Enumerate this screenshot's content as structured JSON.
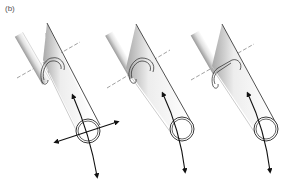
{
  "figure": {
    "panel_label": "(b)",
    "panels": [
      {
        "id": "panel-1",
        "description": "Rod with loop attachment to tube; tube end ring with four-way arrows",
        "arrows": [
          "up",
          "down",
          "left",
          "right"
        ]
      },
      {
        "id": "panel-2",
        "description": "Rod with loop attachment to tube; tube end ring with up/down curved arrow",
        "arrows": [
          "up",
          "down"
        ]
      },
      {
        "id": "panel-3",
        "description": "Rod with clip attachment to tube; tube end ring with up/down curved arrow",
        "arrows": [
          "up",
          "down"
        ]
      }
    ]
  },
  "colors": {
    "line": "#222222",
    "dash": "#777777",
    "shade": "#bbbbbb",
    "background": "#ffffff"
  }
}
